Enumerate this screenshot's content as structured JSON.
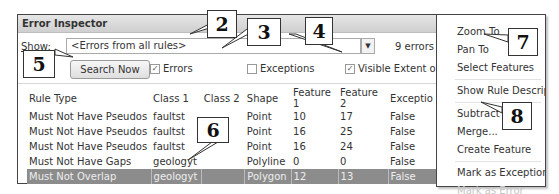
{
  "window": {
    "title": "Error Inspector",
    "show_label": "Show:",
    "show_value": "<Errors from all rules>",
    "error_count": "9 errors",
    "search_button": "Search Now",
    "checkboxes": [
      {
        "label": "Errors",
        "checked": true
      },
      {
        "label": "Exceptions",
        "checked": false
      },
      {
        "label": "Visible Extent o",
        "checked": true
      }
    ]
  },
  "table": {
    "columns": [
      "Rule Type",
      "Class 1",
      "Class 2",
      "Shape",
      "Feature 1",
      "Feature 2",
      "Exceptio"
    ],
    "rows": [
      {
        "rule": "Must Not Have Pseudos",
        "class1": "faultst",
        "class2": "",
        "shape": "Point",
        "f1": "10",
        "f2": "17",
        "exc": "False",
        "selected": false
      },
      {
        "rule": "Must Not Have Pseudos",
        "class1": "faultst",
        "class2": "",
        "shape": "Point",
        "f1": "16",
        "f2": "25",
        "exc": "False",
        "selected": false
      },
      {
        "rule": "Must Not Have Pseudos",
        "class1": "faultst",
        "class2": "",
        "shape": "Point",
        "f1": "16",
        "f2": "24",
        "exc": "False",
        "selected": false
      },
      {
        "rule": "Must Not Have Gaps",
        "class1": "geologyt",
        "class2": "",
        "shape": "Polyline",
        "f1": "0",
        "f2": "0",
        "exc": "False",
        "selected": false
      },
      {
        "rule": "Must Not Overlap",
        "class1": "geologyt",
        "class2": "",
        "shape": "Polygon",
        "f1": "12",
        "f2": "13",
        "exc": "False",
        "selected": true
      }
    ]
  },
  "context_menu": {
    "items": [
      {
        "label": "Zoom To",
        "enabled": true
      },
      {
        "label": "Pan To",
        "enabled": true
      },
      {
        "label": "Select Features",
        "enabled": true
      },
      {
        "label": "Show Rule Description...",
        "enabled": true
      },
      {
        "label": "Subtract",
        "enabled": true
      },
      {
        "label": "Merge...",
        "enabled": true
      },
      {
        "label": "Create Feature",
        "enabled": true
      },
      {
        "label": "Mark as Exception",
        "enabled": true
      },
      {
        "label": "Mark as Error",
        "enabled": false
      }
    ]
  },
  "callouts": [
    "2",
    "3",
    "4",
    "5",
    "6",
    "7",
    "8"
  ],
  "colors": {
    "selected_row": "#8c8c8c",
    "titlebar": "#d9d9d9",
    "disabled_text": "#c6c6c6"
  }
}
